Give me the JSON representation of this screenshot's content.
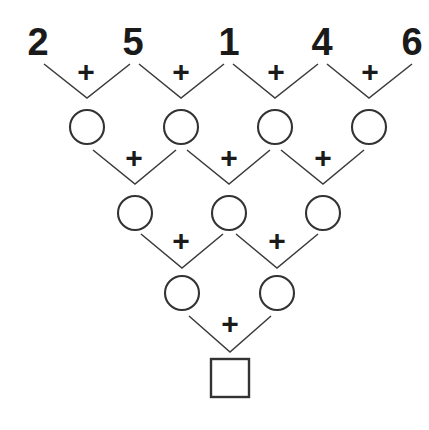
{
  "puzzle": {
    "title": "Addition Pyramid",
    "type": "addition-pyramid",
    "background_color": "#ffffff",
    "stroke_color": "#333333",
    "text_color": "#1a1a1a",
    "operator": "+",
    "rows": [
      {
        "index": 0,
        "cell_shape": "number",
        "count": 5,
        "cells": [
          {
            "label": "2",
            "cx": 38,
            "cy": 45
          },
          {
            "label": "5",
            "cx": 133,
            "cy": 45
          },
          {
            "label": "1",
            "cx": 229,
            "cy": 45
          },
          {
            "label": "4",
            "cx": 322,
            "cy": 45
          },
          {
            "label": "6",
            "cx": 412,
            "cy": 45
          }
        ]
      },
      {
        "index": 1,
        "cell_shape": "circle",
        "count": 4,
        "cells": [
          {
            "label": "",
            "cx": 87,
            "cy": 127,
            "r": 17
          },
          {
            "label": "",
            "cx": 181,
            "cy": 127,
            "r": 17
          },
          {
            "label": "",
            "cx": 275,
            "cy": 127,
            "r": 17
          },
          {
            "label": "",
            "cx": 369,
            "cy": 127,
            "r": 17
          }
        ]
      },
      {
        "index": 2,
        "cell_shape": "circle",
        "count": 3,
        "cells": [
          {
            "label": "",
            "cx": 135,
            "cy": 213,
            "r": 17
          },
          {
            "label": "",
            "cx": 229,
            "cy": 213,
            "r": 17
          },
          {
            "label": "",
            "cx": 323,
            "cy": 213,
            "r": 17
          }
        ]
      },
      {
        "index": 3,
        "cell_shape": "circle",
        "count": 2,
        "cells": [
          {
            "label": "",
            "cx": 182,
            "cy": 293,
            "r": 17
          },
          {
            "label": "",
            "cx": 277,
            "cy": 293,
            "r": 17
          }
        ]
      },
      {
        "index": 4,
        "cell_shape": "square",
        "count": 1,
        "cells": [
          {
            "label": "",
            "cx": 230,
            "cy": 378,
            "size": 38
          }
        ]
      }
    ],
    "operators": [
      {
        "row": 0,
        "label": "+",
        "cx": 86,
        "cy": 74
      },
      {
        "row": 0,
        "label": "+",
        "cx": 181,
        "cy": 74
      },
      {
        "row": 0,
        "label": "+",
        "cx": 276,
        "cy": 74
      },
      {
        "row": 0,
        "label": "+",
        "cx": 370,
        "cy": 74
      },
      {
        "row": 1,
        "label": "+",
        "cx": 134,
        "cy": 160
      },
      {
        "row": 1,
        "label": "+",
        "cx": 229,
        "cy": 160
      },
      {
        "row": 1,
        "label": "+",
        "cx": 323,
        "cy": 160
      },
      {
        "row": 2,
        "label": "+",
        "cx": 181,
        "cy": 243,
        "_": ""
      },
      {
        "row": 2,
        "label": "+",
        "cx": 277,
        "cy": 243
      },
      {
        "row": 3,
        "label": "+",
        "cx": 230,
        "cy": 326
      }
    ],
    "connectors": [
      {
        "row": 0,
        "left_x": 44,
        "left_y": 64,
        "apex_x": 87,
        "apex_y": 98,
        "right_x": 130,
        "right_y": 64
      },
      {
        "row": 0,
        "left_x": 139,
        "left_y": 64,
        "apex_x": 181,
        "apex_y": 98,
        "right_x": 224,
        "right_y": 64
      },
      {
        "row": 0,
        "left_x": 233,
        "left_y": 64,
        "apex_x": 275,
        "apex_y": 98,
        "right_x": 318,
        "right_y": 64
      },
      {
        "row": 0,
        "left_x": 327,
        "left_y": 64,
        "apex_x": 369,
        "apex_y": 98,
        "right_x": 412,
        "right_y": 64
      },
      {
        "row": 1,
        "left_x": 93,
        "left_y": 150,
        "apex_x": 135,
        "apex_y": 184,
        "right_x": 176,
        "right_y": 150
      },
      {
        "row": 1,
        "left_x": 187,
        "left_y": 150,
        "apex_x": 229,
        "apex_y": 184,
        "right_x": 270,
        "right_y": 150
      },
      {
        "row": 1,
        "left_x": 281,
        "left_y": 150,
        "apex_x": 323,
        "apex_y": 184,
        "right_x": 364,
        "right_y": 150
      },
      {
        "row": 2,
        "left_x": 141,
        "left_y": 234,
        "apex_x": 182,
        "apex_y": 268,
        "right_x": 223,
        "right_y": 234
      },
      {
        "row": 2,
        "left_x": 236,
        "left_y": 234,
        "apex_x": 277,
        "apex_y": 268,
        "right_x": 318,
        "right_y": 234
      },
      {
        "row": 3,
        "left_x": 189,
        "left_y": 316,
        "apex_x": 230,
        "apex_y": 352,
        "right_x": 271,
        "right_y": 316
      }
    ]
  }
}
